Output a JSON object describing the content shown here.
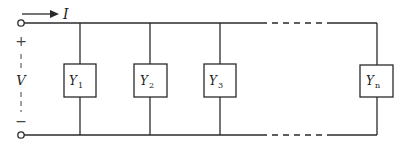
{
  "diagram": {
    "current_label": "I",
    "voltage_label": "V",
    "plus_sign": "+",
    "minus_sign": "−",
    "branches": [
      {
        "symbol": "Y",
        "subscript": "1"
      },
      {
        "symbol": "Y",
        "subscript": "2"
      },
      {
        "symbol": "Y",
        "subscript": "3"
      },
      {
        "symbol": "Y",
        "subscript": "n"
      }
    ],
    "colors": {
      "line": "#2a2a2a",
      "background": "#ffffff"
    }
  }
}
